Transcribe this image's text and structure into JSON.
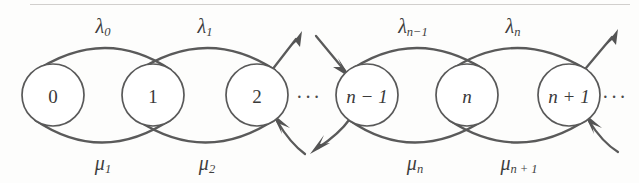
{
  "figure": {
    "kind": "state-transition-diagram",
    "stroke_color": "#5a5a5a",
    "node_stroke_color": "#595959",
    "background_color": "#fdfdfc",
    "text_color": "#3a3a3a"
  },
  "nodes": [
    {
      "id": "s0",
      "label": "0",
      "italic": false,
      "cx": 53,
      "cy": 95,
      "r": 31
    },
    {
      "id": "s1",
      "label": "1",
      "italic": false,
      "cx": 153,
      "cy": 95,
      "r": 31
    },
    {
      "id": "s2",
      "label": "2",
      "italic": false,
      "cx": 257,
      "cy": 95,
      "r": 31
    },
    {
      "id": "sn-1",
      "label": "n − 1",
      "italic": true,
      "cx": 367,
      "cy": 95,
      "r": 31
    },
    {
      "id": "sn",
      "label": "n",
      "italic": true,
      "cx": 467,
      "cy": 95,
      "r": 31
    },
    {
      "id": "sn+1",
      "label": "n + 1",
      "italic": true,
      "cx": 569,
      "cy": 95,
      "r": 31
    }
  ],
  "birth_rates": [
    {
      "id": "lambda0",
      "symbol": "λ",
      "subscript": "0",
      "from": "s0",
      "to": "s1",
      "x": 103,
      "y": 26
    },
    {
      "id": "lambda1",
      "symbol": "λ",
      "subscript": "1",
      "from": "s1",
      "to": "s2",
      "x": 205,
      "y": 26
    },
    {
      "id": "lambdan-1",
      "symbol": "λ",
      "subscript": "n−1",
      "from": "sn-1",
      "to": "sn",
      "x": 413,
      "y": 26
    },
    {
      "id": "lambdan",
      "symbol": "λ",
      "subscript": "n",
      "from": "sn",
      "to": "sn+1",
      "x": 513,
      "y": 26
    }
  ],
  "death_rates": [
    {
      "id": "mu1",
      "symbol": "μ",
      "subscript": "1",
      "from": "s1",
      "to": "s0",
      "x": 103,
      "y": 163
    },
    {
      "id": "mu2",
      "symbol": "μ",
      "subscript": "2",
      "from": "s2",
      "to": "s1",
      "x": 207,
      "y": 163
    },
    {
      "id": "mun",
      "symbol": "μ",
      "subscript": "n",
      "from": "sn",
      "to": "sn-1",
      "x": 415,
      "y": 163
    },
    {
      "id": "mun+1",
      "symbol": "μ",
      "subscript": "n + 1",
      "from": "sn+1",
      "to": "sn",
      "x": 519,
      "y": 163
    }
  ],
  "ellipses": [
    {
      "id": "ellipsis-middle",
      "text": "···",
      "x": 309,
      "y": 97
    },
    {
      "id": "ellipsis-right",
      "text": "···",
      "x": 615,
      "y": 97
    }
  ],
  "edge_stubs": [
    {
      "id": "stub-out-up-right-from-2",
      "direction": "outgoing",
      "orientation": "up-right",
      "from": "s2"
    },
    {
      "id": "stub-in-low-right-to-2",
      "direction": "incoming",
      "orientation": "low-right",
      "to": "s2"
    },
    {
      "id": "stub-in-up-left-to-n-1",
      "direction": "incoming",
      "orientation": "up-left",
      "to": "sn-1"
    },
    {
      "id": "stub-out-low-left-from-n-1",
      "direction": "outgoing",
      "orientation": "low-left",
      "from": "sn-1"
    },
    {
      "id": "stub-out-up-right-from-n+1",
      "direction": "outgoing",
      "orientation": "up-right",
      "from": "sn+1"
    },
    {
      "id": "stub-in-low-right-to-n+1",
      "direction": "incoming",
      "orientation": "low-right",
      "to": "sn+1"
    }
  ]
}
